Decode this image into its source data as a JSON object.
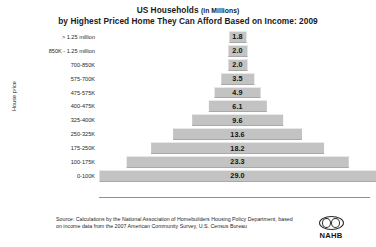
{
  "chart_data": {
    "type": "bar",
    "orientation": "horizontal-centered-pyramid",
    "title": "US Households (in Millions)",
    "title_line1_main": "US Households",
    "title_line1_sub": "(in Millions)",
    "title_line2": "by Highest Priced Home They Can Afford Based on Income: 2009",
    "xlabel": "",
    "ylabel": "House price",
    "grid": false,
    "legend": false,
    "xlim": [
      0,
      29.0
    ],
    "categories": [
      "> 1.25 million",
      "850K - 1.25 million",
      "700-850K",
      "575-700K",
      "475-575K",
      "400-475K",
      "325-400K",
      "250-325K",
      "175-250K",
      "100-175K",
      "0-100K"
    ],
    "values": [
      1.8,
      2.0,
      2.0,
      3.5,
      4.9,
      6.1,
      9.6,
      13.6,
      18.2,
      23.3,
      29.0
    ],
    "rows": [
      {
        "label": "> 1.25 million",
        "value": 1.8,
        "value_text": "1.8"
      },
      {
        "label": "850K - 1.25 million",
        "value": 2.0,
        "value_text": "2.0"
      },
      {
        "label": "700-850K",
        "value": 2.0,
        "value_text": "2.0"
      },
      {
        "label": "575-700K",
        "value": 3.5,
        "value_text": "3.5"
      },
      {
        "label": "475-575K",
        "value": 4.9,
        "value_text": "4.9"
      },
      {
        "label": "400-475K",
        "value": 6.1,
        "value_text": "6.1"
      },
      {
        "label": "325-400K",
        "value": 9.6,
        "value_text": "9.6"
      },
      {
        "label": "250-325K",
        "value": 13.6,
        "value_text": "13.6"
      },
      {
        "label": "175-250K",
        "value": 18.2,
        "value_text": "18.2"
      },
      {
        "label": "100-175K",
        "value": 23.3,
        "value_text": "23.3"
      },
      {
        "label": "0-100K",
        "value": 29.0,
        "value_text": "29.0"
      }
    ],
    "bar_color": "#c3c3c3"
  },
  "footer": {
    "line1": "Source: Calculations by the National Association of Homebuilders Housing Policy Department, based",
    "line2": "on income data from the 2007 American Community Survey, U.S. Census Bureau"
  },
  "logo": {
    "text": "NAHB"
  }
}
